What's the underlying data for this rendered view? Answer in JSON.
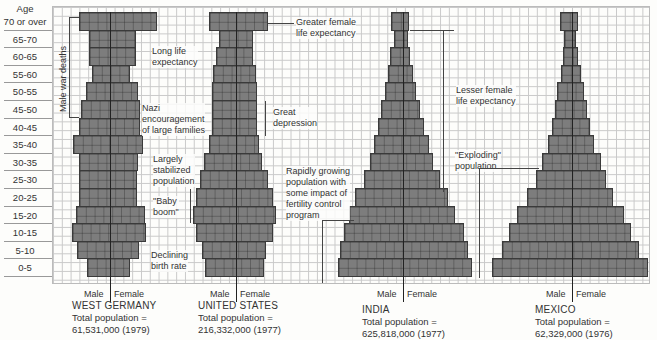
{
  "chart_data": {
    "type": "bar",
    "subtype": "population-pyramid",
    "title": "",
    "ylabel": "Age",
    "xlabel_left": "Male",
    "xlabel_right": "Female",
    "grid": true,
    "categories": [
      "70 or over",
      "65-70",
      "60-65",
      "55-60",
      "50-55",
      "45-50",
      "40-45",
      "35-40",
      "30-35",
      "25-30",
      "20-25",
      "15-20",
      "10-15",
      "5-10",
      "0-5"
    ],
    "units_note": "bar extents in grid pixel columns relative to each pyramid's center axis (left=male, right=female)",
    "series": [
      {
        "name": "WEST GERMANY",
        "caption_line1": "Total population =",
        "caption_line2": "61,531,000 (1979)",
        "center": 110,
        "male": [
          31,
          21,
          21,
          18,
          24,
          29,
          31,
          37,
          31,
          31,
          31,
          34,
          38,
          33,
          23
        ],
        "female": [
          47,
          26,
          26,
          20,
          28,
          30,
          30,
          33,
          28,
          27,
          27,
          35,
          36,
          29,
          20
        ]
      },
      {
        "name": "UNITED STATES",
        "caption_line1": "Total population =",
        "caption_line2": "216,332,000 (1977)",
        "center": 236,
        "male": [
          27,
          17,
          20,
          23,
          24,
          24,
          24,
          27,
          32,
          36,
          40,
          43,
          40,
          34,
          31
        ],
        "female": [
          32,
          17,
          17,
          20,
          21,
          21,
          21,
          23,
          26,
          32,
          37,
          40,
          37,
          30,
          28
        ]
      },
      {
        "name": "INDIA",
        "caption_line1": "Total population =",
        "caption_line2": "625,818,000 (1977)",
        "center": 403,
        "male": [
          12,
          9,
          13,
          15,
          18,
          22,
          25,
          29,
          33,
          39,
          48,
          54,
          59,
          63,
          65
        ],
        "female": [
          6,
          5,
          7,
          10,
          13,
          17,
          21,
          26,
          30,
          37,
          45,
          52,
          61,
          65,
          69
        ]
      },
      {
        "name": "MEXICO",
        "caption_line1": "Total population =",
        "caption_line2": "62,329,000 (1976)",
        "center": 572,
        "male": [
          12,
          8,
          9,
          11,
          15,
          17,
          20,
          24,
          30,
          36,
          45,
          55,
          63,
          70,
          80
        ],
        "female": [
          6,
          4,
          6,
          9,
          12,
          15,
          18,
          22,
          29,
          34,
          41,
          52,
          59,
          67,
          76
        ]
      }
    ],
    "annotations": [
      "Male war deaths",
      "Long life expectancy",
      "Nazi encouragement of large families",
      "Largely stabilized population",
      "\"Baby boom\"",
      "Declining birth rate",
      "Greater female life expectancy",
      "Great depression",
      "Rapidly growing population with some impact of fertility control program",
      "Lesser female life expectancy",
      "\"Exploding\" population"
    ]
  },
  "labels": {
    "age_header": "Age",
    "male": "Male",
    "female": "Female"
  },
  "ann": {
    "male_war_deaths": "Male war deaths",
    "long_life_1": "Long life",
    "long_life_2": "expectancy",
    "nazi_1": "Nazi",
    "nazi_2": "encouragement",
    "nazi_3": "of large families",
    "stab_1": "Largely",
    "stab_2": "stabilized",
    "stab_3": "population",
    "baby_1": "\"Baby",
    "baby_2": "boom\"",
    "decl_1": "Declining",
    "decl_2": "birth rate",
    "greater_1": "Greater female",
    "greater_2": "life expectancy",
    "great_dep_1": "Great",
    "great_dep_2": "depression",
    "rapid_1": "Rapidly growing",
    "rapid_2": "population with",
    "rapid_3": "some impact of",
    "rapid_4": "fertility control",
    "rapid_5": "program",
    "lesser_1": "Lesser female",
    "lesser_2": "life expectancy",
    "expl_1": "\"Exploding\"",
    "expl_2": "population"
  },
  "colors": {
    "bar_fill": "#7d7d7d",
    "bar_edge": "#3a3a3a",
    "grid_line": "#c9c9c9",
    "paper": "#fdfdfb"
  }
}
